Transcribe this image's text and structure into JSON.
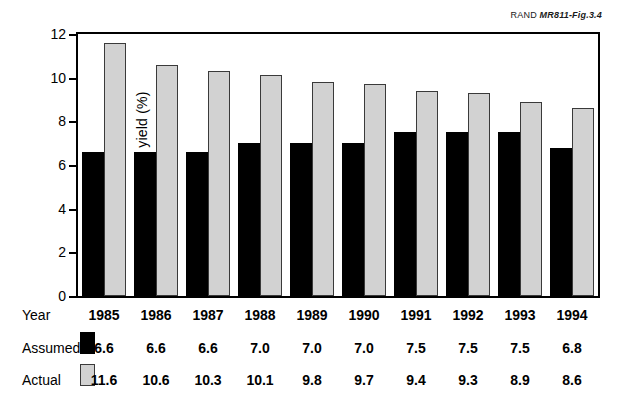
{
  "figure": {
    "source_label_prefix": "RAND ",
    "source_label_id": "MR811-Fig.3.4"
  },
  "table": {
    "row_labels": {
      "year": "Year",
      "assumed": "Assumed",
      "actual": "Actual"
    }
  },
  "chart_data": {
    "type": "bar",
    "title": "",
    "xlabel": "Year",
    "ylabel": "Fund yield (%)",
    "ylim": [
      0,
      12
    ],
    "yticks": [
      0,
      2,
      4,
      6,
      8,
      10,
      12
    ],
    "ytick_labels": [
      "0",
      "2",
      "4",
      "6",
      "8",
      "10",
      "12"
    ],
    "grid": false,
    "legend_position": "bottom-table",
    "categories": [
      "1985",
      "1986",
      "1987",
      "1988",
      "1989",
      "1990",
      "1991",
      "1992",
      "1993",
      "1994"
    ],
    "series": [
      {
        "name": "Assumed",
        "color": "#000000",
        "values": [
          6.6,
          6.6,
          6.6,
          7.0,
          7.0,
          7.0,
          7.5,
          7.5,
          7.5,
          6.8
        ],
        "labels": [
          "6.6",
          "6.6",
          "6.6",
          "7.0",
          "7.0",
          "7.0",
          "7.5",
          "7.5",
          "7.5",
          "6.8"
        ]
      },
      {
        "name": "Actual",
        "color": "#d2d2d2",
        "values": [
          11.6,
          10.6,
          10.3,
          10.1,
          9.8,
          9.7,
          9.4,
          9.3,
          8.9,
          8.6
        ],
        "labels": [
          "11.6",
          "10.6",
          "10.3",
          "10.1",
          "9.8",
          "9.7",
          "9.4",
          "9.3",
          "8.9",
          "8.6"
        ]
      }
    ]
  }
}
